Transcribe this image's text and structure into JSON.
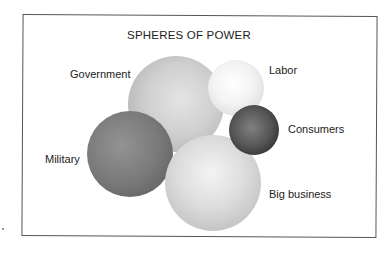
{
  "diagram": {
    "title": "SPHERES OF POWER",
    "spheres": [
      {
        "name": "Government",
        "cx": 176,
        "cy": 104,
        "r": 48,
        "light": "#e2e2e2",
        "dark": "#a9a9a9"
      },
      {
        "name": "Labor",
        "cx": 236,
        "cy": 88,
        "r": 28,
        "light": "#ffffff",
        "dark": "#d2d2d2"
      },
      {
        "name": "Consumers",
        "cx": 254,
        "cy": 130,
        "r": 25,
        "light": "#7a7a7a",
        "dark": "#1e1e1e"
      },
      {
        "name": "Military",
        "cx": 130,
        "cy": 154,
        "r": 43,
        "light": "#8e8e8e",
        "dark": "#5a5a5a"
      },
      {
        "name": "Big business",
        "cx": 213,
        "cy": 183,
        "r": 48,
        "light": "#f1f1f1",
        "dark": "#b5b5b5"
      }
    ],
    "labels": {
      "government": "Government",
      "labor": "Labor",
      "consumers": "Consumers",
      "military": "Military",
      "big_business": "Big business"
    }
  }
}
